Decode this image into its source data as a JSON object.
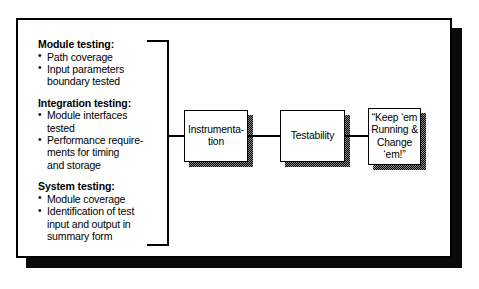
{
  "diagram": {
    "type": "flow-diagram",
    "background_color": "#ffffff",
    "line_color": "#000000",
    "shadow_color": "#0a0a0a",
    "box_shadow_pattern": "stipple-50-gray",
    "groups": [
      {
        "id": "module-testing",
        "heading": "Module testing:",
        "bullets": [
          "Path coverage",
          "Input parameters boundary tested"
        ]
      },
      {
        "id": "integration-testing",
        "heading": "Integration testing:",
        "bullets": [
          "Module interfaces tested",
          "Performance require-ments for timing and storage"
        ]
      },
      {
        "id": "system-testing",
        "heading": "System testing:",
        "bullets": [
          "Module coverage",
          "Identification of test input and output in summary form"
        ]
      }
    ],
    "bullet_lines": {
      "module_testing": [
        [
          "Path coverage"
        ],
        [
          "Input parameters",
          "boundary tested"
        ]
      ],
      "integration_testing": [
        [
          "Module interfaces",
          "tested"
        ],
        [
          "Performance require-",
          "ments for timing",
          "and storage"
        ]
      ],
      "system_testing": [
        [
          "Module coverage"
        ],
        [
          "Identification of test",
          "input and output in",
          "summary form"
        ]
      ]
    },
    "boxes": [
      {
        "id": "instrumentation",
        "label": "Instrumenta-\ntion",
        "line1": "Instrumenta-",
        "line2": "tion"
      },
      {
        "id": "testability",
        "label": "Testability",
        "line1": "Testability",
        "line2": ""
      },
      {
        "id": "keep-em-running",
        "label": "“Keep ‘em Running & Change ‘em!”",
        "line1": "“Keep ‘em",
        "line2": "Running &",
        "line3": "Change",
        "line4": "‘em!”"
      }
    ],
    "connectors": [
      {
        "id": "bracket-to-instrumentation",
        "from": "testing-groups-bracket",
        "to": "instrumentation"
      },
      {
        "id": "instrumentation-to-testability",
        "from": "instrumentation",
        "to": "testability"
      },
      {
        "id": "testability-to-keep-em",
        "from": "testability",
        "to": "keep-em-running"
      }
    ]
  }
}
